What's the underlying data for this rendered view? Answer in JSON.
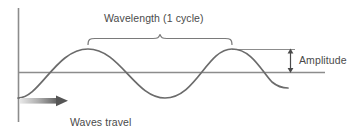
{
  "diagram": {
    "labels": {
      "wavelength": "Wavelength (1 cycle)",
      "amplitude": "Amplitude",
      "waves_travel_line1": "Waves travel",
      "waves_travel_line2": "past a point"
    },
    "colors": {
      "wave_stroke": "#6b6b6b",
      "axis": "#8c8c8c",
      "brace": "#7a7a7a",
      "arrow_dark": "#555555",
      "arrow_light": "#dcdcdc",
      "text": "#4a4a4a",
      "background": "#ffffff"
    },
    "geometry": {
      "vertical_axis_x": 18,
      "vertical_axis_top": 8,
      "vertical_axis_bottom": 122,
      "midline_y": 72,
      "midline_start_x": 18,
      "midline_end_x": 325,
      "crest_y": 49,
      "trough_y": 98,
      "crest1_x": 88,
      "trough1_x": 165,
      "crest2_x": 232,
      "wave_start_x": 18,
      "wave_end_x": 288,
      "amplitude_arrow_x": 290,
      "brace_left_x": 88,
      "brace_right_x": 232,
      "brace_y": 40,
      "travel_arrow_y": 101,
      "travel_arrow_start_x": 20,
      "travel_arrow_end_x": 68
    }
  }
}
